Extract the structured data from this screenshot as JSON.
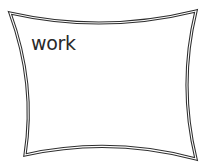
{
  "frame": {
    "label": "work",
    "border_color": "#333333",
    "inner_color": "#ffffff",
    "corners": {
      "top_left": [
        10,
        13
      ],
      "top_right": [
        196,
        11
      ],
      "bottom_right": [
        196,
        159
      ],
      "bottom_left": [
        25,
        155
      ]
    }
  }
}
